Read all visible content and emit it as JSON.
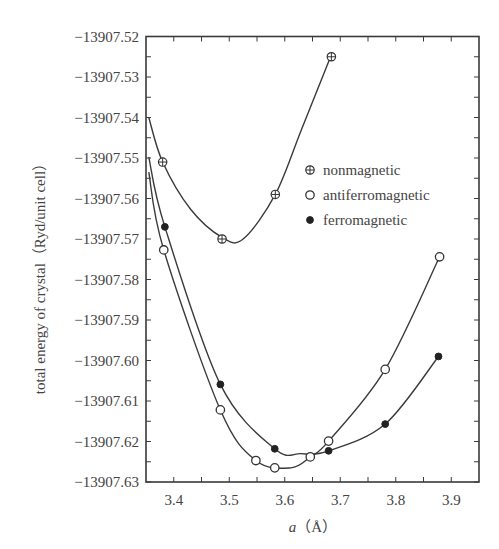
{
  "chart_data": {
    "type": "line",
    "title": "",
    "xlabel": "a（Å）",
    "xlabel_parts": {
      "italic": "a",
      "unit": "（Å）"
    },
    "ylabel": "total energy of crystal（Ryd/unit cell）",
    "xlim": [
      3.35,
      3.95
    ],
    "ylim": [
      -13907.63,
      -13907.52
    ],
    "xticks": [
      3.4,
      3.5,
      3.6,
      3.7,
      3.8,
      3.9
    ],
    "xtick_labels": [
      "3.4",
      "3.5",
      "3.6",
      "3.7",
      "3.8",
      "3.9"
    ],
    "yticks": [
      -13907.52,
      -13907.53,
      -13907.54,
      -13907.55,
      -13907.56,
      -13907.57,
      -13907.58,
      -13907.59,
      -13907.6,
      -13907.61,
      -13907.62,
      -13907.63
    ],
    "ytick_labels": [
      "−13907.52",
      "−13907.53",
      "−13907.54",
      "−13907.55",
      "−13907.56",
      "−13907.57",
      "−13907.58",
      "−13907.59",
      "−13907.60",
      "−13907.61",
      "−13907.62",
      "−13907.63"
    ],
    "grid": false,
    "legend_position": "upper right (inside)",
    "series": [
      {
        "name": "nonmagnetic",
        "marker": "circle-plus",
        "x": [
          3.38,
          3.487,
          3.583,
          3.684
        ],
        "y": [
          -13907.551,
          -13907.57,
          -13907.559,
          -13907.525
        ],
        "curve": [
          [
            3.355,
            -13907.54
          ],
          [
            3.38,
            -13907.551
          ],
          [
            3.43,
            -13907.5626
          ],
          [
            3.487,
            -13907.5696
          ],
          [
            3.525,
            -13907.57
          ],
          [
            3.583,
            -13907.559
          ],
          [
            3.63,
            -13907.543
          ],
          [
            3.684,
            -13907.5245
          ]
        ]
      },
      {
        "name": "antiferromagnetic",
        "marker": "open-circle",
        "x": [
          3.382,
          3.484,
          3.548,
          3.582,
          3.646,
          3.679,
          3.781,
          3.879
        ],
        "y": [
          -13907.5727,
          -13907.6122,
          -13907.6247,
          -13907.6265,
          -13907.6238,
          -13907.6199,
          -13907.6022,
          -13907.5744
        ],
        "curve": [
          [
            3.355,
            -13907.5535
          ],
          [
            3.382,
            -13907.5727
          ],
          [
            3.484,
            -13907.6122
          ],
          [
            3.548,
            -13907.6247
          ],
          [
            3.611,
            -13907.6265
          ],
          [
            3.646,
            -13907.6238
          ],
          [
            3.679,
            -13907.6199
          ],
          [
            3.781,
            -13907.6022
          ],
          [
            3.879,
            -13907.5744
          ]
        ]
      },
      {
        "name": "ferromagnetic",
        "marker": "filled-circle",
        "x": [
          3.384,
          3.484,
          3.582,
          3.679,
          3.781,
          3.877
        ],
        "y": [
          -13907.567,
          -13907.6059,
          -13907.6218,
          -13907.6223,
          -13907.6157,
          -13907.599
        ],
        "curve": [
          [
            3.355,
            -13907.5498
          ],
          [
            3.384,
            -13907.567
          ],
          [
            3.484,
            -13907.6059
          ],
          [
            3.582,
            -13907.6218
          ],
          [
            3.629,
            -13907.623
          ],
          [
            3.679,
            -13907.6223
          ],
          [
            3.781,
            -13907.6157
          ],
          [
            3.877,
            -13907.599
          ]
        ]
      }
    ]
  },
  "colors": {
    "line": "#3a3a3a",
    "text": "#444444",
    "background": "#ffffff"
  }
}
